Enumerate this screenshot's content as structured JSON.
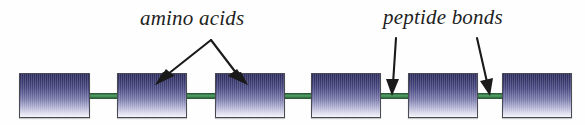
{
  "figure": {
    "background_color": "#fefefe"
  },
  "labels": {
    "amino_acids": "amino acids",
    "peptide_bonds": "peptide bonds"
  },
  "colors": {
    "box_gradient_top": "#2b2b5c",
    "box_gradient_bottom": "#f4f4fa",
    "box_border": "#4a4a52",
    "connector_green": "#448a57",
    "connector_border": "#2a5d38",
    "arrow_color": "#1a1a1a",
    "text_color": "#1f1f1f"
  },
  "chain": {
    "unit_count": 6,
    "bond_count": 5,
    "boxes": [
      {
        "name": "amino-acid-1",
        "x": 19,
        "y": 73,
        "width": 71,
        "height": 45
      },
      {
        "name": "amino-acid-2",
        "x": 117,
        "y": 73,
        "width": 70,
        "height": 45
      },
      {
        "name": "amino-acid-3",
        "x": 215,
        "y": 73,
        "width": 70,
        "height": 45
      },
      {
        "name": "amino-acid-4",
        "x": 311,
        "y": 73,
        "width": 70,
        "height": 45
      },
      {
        "name": "amino-acid-5",
        "x": 408,
        "y": 73,
        "width": 70,
        "height": 45
      },
      {
        "name": "amino-acid-6",
        "x": 502,
        "y": 73,
        "width": 70,
        "height": 45
      }
    ],
    "bonds": [
      {
        "name": "peptide-bond-1",
        "x": 88,
        "y": 93,
        "width": 31
      },
      {
        "name": "peptide-bond-2",
        "x": 185,
        "y": 93,
        "width": 32
      },
      {
        "name": "peptide-bond-3",
        "x": 283,
        "y": 93,
        "width": 30
      },
      {
        "name": "peptide-bond-4",
        "x": 379,
        "y": 93,
        "width": 31
      },
      {
        "name": "peptide-bond-5",
        "x": 476,
        "y": 93,
        "width": 28
      }
    ]
  },
  "annotations": {
    "amino_acids_pointer": {
      "type": "forked-arrow",
      "apex": [
        211,
        39
      ],
      "targets": [
        [
          157,
          83
        ],
        [
          246,
          83
        ]
      ]
    },
    "peptide_bonds_pointers": [
      {
        "type": "arrow",
        "from": [
          396,
          38
        ],
        "to": [
          393,
          95
        ]
      },
      {
        "type": "arrow",
        "from": [
          477,
          38
        ],
        "to": [
          490,
          95
        ]
      }
    ]
  }
}
